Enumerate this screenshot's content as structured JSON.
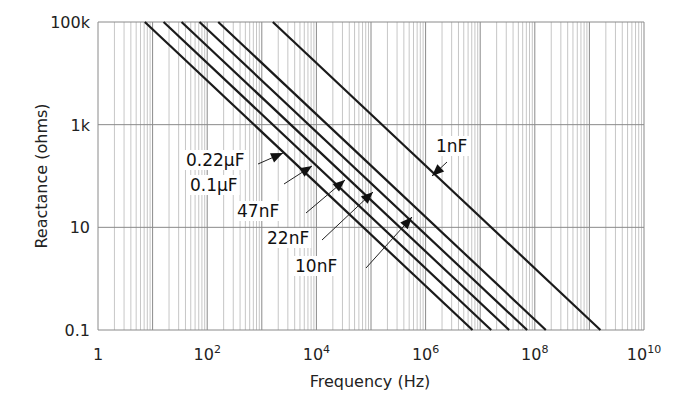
{
  "chart_data": {
    "type": "line",
    "title": "",
    "xlabel": "Frequency (Hz)",
    "ylabel": "Reactance (ohms)",
    "xscale": "log",
    "yscale": "log",
    "xlim": [
      1,
      10000000000
    ],
    "ylim": [
      0.1,
      100000
    ],
    "grid": true,
    "x_tick_labels": [
      {
        "value": 1,
        "base": "1",
        "exp": ""
      },
      {
        "value": 100,
        "base": "10",
        "exp": "2"
      },
      {
        "value": 10000,
        "base": "10",
        "exp": "4"
      },
      {
        "value": 1000000,
        "base": "10",
        "exp": "6"
      },
      {
        "value": 100000000,
        "base": "10",
        "exp": "8"
      },
      {
        "value": 10000000000,
        "base": "10",
        "exp": "10"
      }
    ],
    "y_tick_labels": [
      {
        "value": 100000,
        "label": "100k"
      },
      {
        "value": 1000,
        "label": "1k"
      },
      {
        "value": 10,
        "label": "10"
      },
      {
        "value": 0.1,
        "label": "0.1"
      }
    ],
    "formula": "Xc = 1 / (2*pi*f*C)",
    "series": [
      {
        "name": "0.22µF",
        "capacitance_F": 2.2e-07,
        "points": [
          [
            7.2,
            100000
          ],
          [
            7234000,
            0.1
          ]
        ]
      },
      {
        "name": "0.1µF",
        "capacitance_F": 1e-07,
        "points": [
          [
            15.9,
            100000
          ],
          [
            15915000,
            0.1
          ]
        ]
      },
      {
        "name": "47nF",
        "capacitance_F": 4.7e-08,
        "points": [
          [
            33.9,
            100000
          ],
          [
            33863000,
            0.1
          ]
        ]
      },
      {
        "name": "22nF",
        "capacitance_F": 2.2e-08,
        "points": [
          [
            72.3,
            100000
          ],
          [
            72343000,
            0.1
          ]
        ]
      },
      {
        "name": "10nF",
        "capacitance_F": 1e-08,
        "points": [
          [
            159.2,
            100000
          ],
          [
            159155000,
            0.1
          ]
        ]
      },
      {
        "name": "1nF",
        "capacitance_F": 1e-09,
        "points": [
          [
            1591.5,
            100000
          ],
          [
            1591550000,
            0.1
          ]
        ]
      }
    ],
    "annotations": [
      {
        "text": "0.22µF",
        "label_x": 186,
        "label_y": 166,
        "arrow_from": [
          258,
          164
        ],
        "arrow_to": [
          283,
          153
        ]
      },
      {
        "text": "0.1µF",
        "label_x": 190,
        "label_y": 191,
        "arrow_from": [
          284,
          184
        ],
        "arrow_to": [
          312,
          166
        ]
      },
      {
        "text": "47nF",
        "label_x": 237,
        "label_y": 217,
        "arrow_from": [
          306,
          213
        ],
        "arrow_to": [
          345,
          180
        ]
      },
      {
        "text": "22nF",
        "label_x": 267,
        "label_y": 244,
        "arrow_from": [
          322,
          240
        ],
        "arrow_to": [
          373,
          192
        ]
      },
      {
        "text": "10nF",
        "label_x": 295,
        "label_y": 272,
        "arrow_from": [
          366,
          268
        ],
        "arrow_to": [
          412,
          217
        ]
      },
      {
        "text": "1nF",
        "label_x": 436,
        "label_y": 152,
        "arrow_from": [
          447,
          162
        ],
        "arrow_to": [
          432,
          176
        ]
      }
    ]
  },
  "colors": {
    "line": "#1a1a1a",
    "grid_major": "#8a8a8a",
    "grid_minor": "#b8b8b8",
    "text": "#222222",
    "background": "#ffffff"
  }
}
